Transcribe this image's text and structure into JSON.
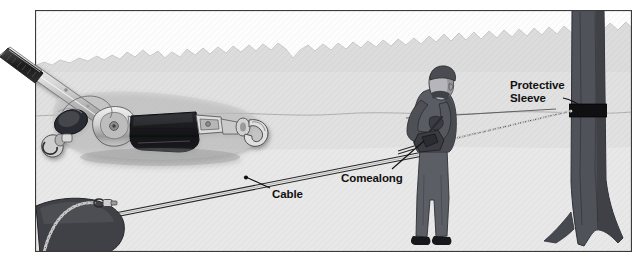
{
  "illustration": {
    "title": "Comealong rigging to a tree with protective sleeve",
    "type": "grayscale technical illustration with photographic inset",
    "frame": {
      "x": 35,
      "y": 10,
      "width": 597,
      "height": 242,
      "border_color": "#3a3a3a",
      "background": "#f2f2f2"
    },
    "palette": {
      "sky": "#fbfbfb",
      "hill_band": "#c4c4c4",
      "midground": "#cacaca",
      "foreground": "#d7d7d7",
      "tree_trunk": "#4f5156",
      "tree_trunk_shadow": "#3a3c41",
      "sleeve_black": "#111111",
      "person_clothing": "#5a5c62",
      "person_skin": "#b9b9bc",
      "cable_line": "#2a2a2a",
      "label_text": "#111111",
      "photo_metal_light": "#e6e6e6",
      "photo_metal_mid": "#a8a8a8",
      "photo_dark": "#15161a"
    },
    "labels": [
      {
        "name": "protective-sleeve",
        "lines": [
          "Protective",
          "Sleeve"
        ],
        "text": "Protective Sleeve",
        "x": 510,
        "y": 79,
        "leader_from": [
          566,
          98
        ],
        "leader_to": [
          586,
          110
        ]
      },
      {
        "name": "comealong",
        "lines": [
          "Comealong"
        ],
        "text": "Comealong",
        "x": 341,
        "y": 172,
        "leader_from": [
          392,
          170
        ],
        "leader_to": [
          424,
          142
        ]
      },
      {
        "name": "cable",
        "lines": [
          "Cable"
        ],
        "text": "Cable",
        "x": 272,
        "y": 188,
        "leader_from": [
          268,
          190
        ],
        "leader_to": [
          247,
          179
        ],
        "leader_dot": [
          246,
          178
        ]
      }
    ],
    "scene_elements": [
      {
        "name": "sky",
        "description": "near-white sky above jagged tree-line horizon"
      },
      {
        "name": "hill-treeline",
        "description": "jagged gray hill/treeline silhouette across upper third"
      },
      {
        "name": "midground-ground",
        "description": "light gray ground plane with wavy horizon line"
      },
      {
        "name": "foreground-ground",
        "description": "lighter gray foreground strip at bottom"
      },
      {
        "name": "tree",
        "description": "dark gray tree trunk at right with flared roots at base"
      },
      {
        "name": "protective-sleeve-band",
        "description": "black band wrapped around tree trunk where chain bears"
      },
      {
        "name": "person",
        "description": "worker in dark clothing operating the comealong, facing left"
      },
      {
        "name": "chain",
        "description": "chain running from comealong to protective sleeve on tree"
      },
      {
        "name": "cable",
        "description": "steel cable running from comealong down-left to anchored load"
      },
      {
        "name": "load-object",
        "description": "dark anchored object at lower left with chain choker"
      },
      {
        "name": "comealong-photo-inset",
        "description": "photographic cutout of a ratchet cable puller overlaying the upper-left, handle extending past the frame edge"
      }
    ]
  }
}
